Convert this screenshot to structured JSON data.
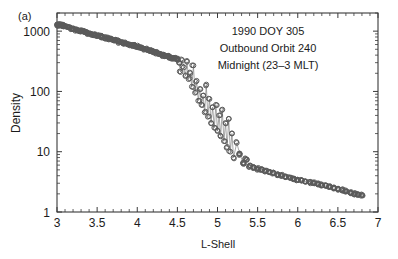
{
  "panel": {
    "label": "(a)"
  },
  "annotations": {
    "line1": "1990 DOY 305",
    "line2": "Outbound Orbit 240",
    "line3": "Midnight (23–3 MLT)"
  },
  "axes": {
    "x_title": "L-Shell",
    "y_title": "Density",
    "x_ticks": [
      "3",
      "3.5",
      "4",
      "4.5",
      "5",
      "5.5",
      "6",
      "6.5",
      "7"
    ],
    "y_ticks": [
      "1",
      "10",
      "100",
      "1000"
    ]
  },
  "style": {
    "marker_color": "#6e6e6e",
    "marker_edge": "#5a5a5a",
    "axis_color": "#3a3a3a",
    "text_color": "#1b1b1b"
  },
  "chart_data": {
    "type": "scatter",
    "title": "",
    "subtitle": "",
    "xlabel": "L-Shell",
    "ylabel": "Density",
    "xlim": [
      3,
      7
    ],
    "ylim": [
      1,
      2000
    ],
    "yscale": "log",
    "xscale": "linear",
    "grid": false,
    "legend": null,
    "x_ticks": [
      3,
      3.5,
      4,
      4.5,
      5,
      5.5,
      6,
      6.5,
      7
    ],
    "y_ticks": [
      1,
      10,
      100,
      1000
    ],
    "annotations": [
      "1990 DOY 305",
      "Outbound Orbit 240",
      "Midnight (23–3 MLT)"
    ],
    "marker": "open-circle",
    "connected": true,
    "series": [
      {
        "name": "Electron density profile",
        "x": [
          3.0,
          3.03,
          3.06,
          3.09,
          3.12,
          3.15,
          3.18,
          3.21,
          3.24,
          3.27,
          3.3,
          3.33,
          3.36,
          3.39,
          3.42,
          3.45,
          3.48,
          3.51,
          3.54,
          3.57,
          3.6,
          3.63,
          3.66,
          3.69,
          3.72,
          3.75,
          3.78,
          3.81,
          3.84,
          3.87,
          3.9,
          3.93,
          3.96,
          3.99,
          4.02,
          4.05,
          4.08,
          4.11,
          4.14,
          4.17,
          4.2,
          4.23,
          4.26,
          4.29,
          4.32,
          4.35,
          4.38,
          4.41,
          4.44,
          4.47,
          4.5,
          4.52,
          4.54,
          4.56,
          4.58,
          4.6,
          4.62,
          4.64,
          4.66,
          4.68,
          4.7,
          4.72,
          4.74,
          4.76,
          4.78,
          4.8,
          4.82,
          4.84,
          4.86,
          4.88,
          4.9,
          4.92,
          4.94,
          4.96,
          4.98,
          5.0,
          5.02,
          5.04,
          5.06,
          5.08,
          5.1,
          5.12,
          5.14,
          5.16,
          5.18,
          5.2,
          5.24,
          5.28,
          5.32,
          5.36,
          5.4,
          5.45,
          5.5,
          5.55,
          5.6,
          5.65,
          5.7,
          5.75,
          5.8,
          5.85,
          5.9,
          5.95,
          6.0,
          6.05,
          6.1,
          6.15,
          6.2,
          6.25,
          6.3,
          6.35,
          6.4,
          6.45,
          6.5,
          6.55,
          6.6,
          6.65,
          6.7,
          6.75,
          6.8
        ],
        "y": [
          1280,
          1265,
          1240,
          1230,
          1200,
          1150,
          1100,
          1080,
          1040,
          1010,
          1000,
          980,
          950,
          930,
          900,
          880,
          860,
          840,
          820,
          800,
          780,
          760,
          740,
          720,
          700,
          680,
          660,
          645,
          630,
          615,
          600,
          585,
          570,
          555,
          540,
          525,
          510,
          500,
          485,
          470,
          455,
          440,
          430,
          415,
          400,
          390,
          380,
          370,
          360,
          350,
          340,
          300,
          210,
          330,
          250,
          180,
          310,
          160,
          200,
          120,
          270,
          95,
          150,
          70,
          110,
          60,
          85,
          45,
          130,
          38,
          75,
          30,
          55,
          25,
          60,
          22,
          40,
          18,
          50,
          15,
          30,
          12,
          35,
          10,
          20,
          8,
          14,
          9,
          6.5,
          7.5,
          5.8,
          5.5,
          5.2,
          5.0,
          4.8,
          4.6,
          4.4,
          4.2,
          4.0,
          3.9,
          3.7,
          3.6,
          3.4,
          3.3,
          3.2,
          3.1,
          3.0,
          2.9,
          2.8,
          2.7,
          2.6,
          2.5,
          2.4,
          2.3,
          2.2,
          2.1,
          2.0,
          1.95,
          1.9
        ]
      }
    ]
  }
}
